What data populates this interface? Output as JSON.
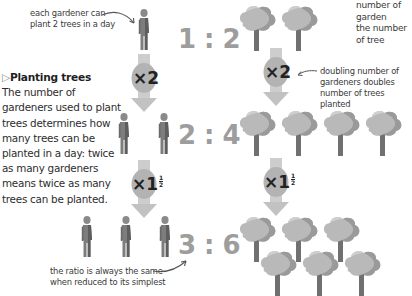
{
  "annotations": {
    "gardener_note": [
      "each gardener can",
      "plant 2 trees in a day"
    ],
    "top_right_note": [
      "number of garden",
      "the number of tree"
    ],
    "doubling_note": [
      "doubling number of",
      "gardeners doubles",
      "number of trees planted"
    ],
    "ratio_note": [
      "the ratio is always the same",
      "when reduced to its simplest"
    ]
  },
  "sidebar": {
    "heading_marker": "▷",
    "heading": "Planting trees",
    "body_lines": [
      "The number of",
      "gardeners used to plant",
      "trees determines how",
      "many trees can be",
      "planted in a day: twice",
      "as many gardeners",
      "means twice as many",
      "trees can be planted."
    ]
  },
  "rows": [
    {
      "gardeners": 1,
      "trees": 2,
      "ratio_left": "1",
      "ratio_sep": ":",
      "ratio_right": "2"
    },
    {
      "gardeners": 2,
      "trees": 4,
      "ratio_left": "2",
      "ratio_sep": ":",
      "ratio_right": "4"
    },
    {
      "gardeners": 3,
      "trees": 6,
      "ratio_left": "3",
      "ratio_sep": ":",
      "ratio_right": "6"
    }
  ],
  "multipliers": {
    "first": {
      "prefix": "×",
      "whole": "2"
    },
    "second": {
      "prefix": "×",
      "whole": "1",
      "frac_num": "1",
      "frac_den": "2"
    }
  },
  "colors": {
    "figure": "#7a7a7a",
    "figure_dark": "#555555",
    "tree_crown": "#b8b8b8",
    "tree_trunk": "#6e6e6e",
    "arrow": "#c9c9c9",
    "ratio_text": "#9d9d9d"
  }
}
